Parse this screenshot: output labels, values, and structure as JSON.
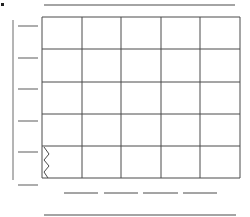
{
  "diagram": {
    "type": "wireframe-grid-sketch",
    "stroke_color": "#4a4a4a",
    "light_stroke_color": "#6a6a6a",
    "background": "#ffffff",
    "marker_dot": {
      "x": 2,
      "y": 4,
      "size": 3
    },
    "top_line": {
      "x1": 44,
      "x2": 235,
      "y": 5
    },
    "left_axis": {
      "x": 13,
      "y1": 20,
      "y2": 180
    },
    "left_ticks": {
      "x1": 18,
      "x2": 38,
      "ys": [
        26,
        58,
        89,
        121,
        152,
        185
      ]
    },
    "grid": {
      "columns_x": [
        42,
        82,
        121,
        161,
        200,
        240
      ],
      "rows_y": [
        17,
        49,
        82,
        114,
        146,
        178
      ],
      "rows": 5,
      "cols": 5
    },
    "zigzag": {
      "cell_row": 4,
      "cell_col": 0,
      "points": "44,147 49,154 44,160 49,166 44,172 48,178"
    },
    "bottom_dashes": {
      "y": 193,
      "segments": [
        [
          64,
          98
        ],
        [
          104,
          138
        ],
        [
          143,
          178
        ],
        [
          183,
          217
        ]
      ]
    },
    "bottom_line": {
      "x1": 44,
      "x2": 236,
      "y": 215
    }
  }
}
